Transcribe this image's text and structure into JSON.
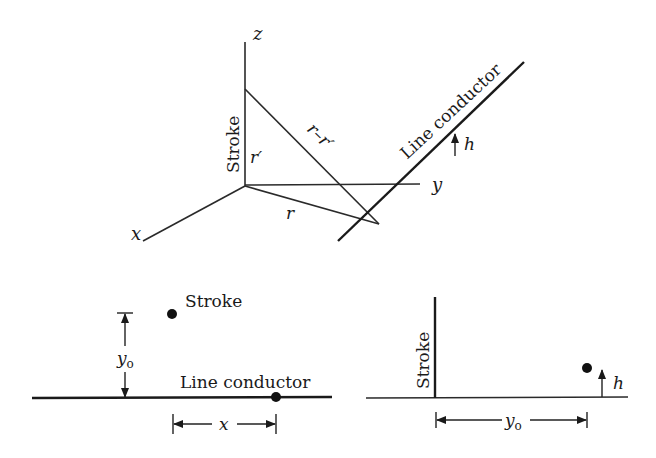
{
  "figure": {
    "top_panel": {
      "axes": {
        "x_label": "x",
        "y_label": "y",
        "z_label": "z"
      },
      "stroke_label": "Stroke",
      "r_label": "r",
      "r_prime_label": "r′",
      "r_minus_r_prime_label": "r–r′",
      "conductor_label": "Line conductor",
      "height_label": "h"
    },
    "bottom_left_panel": {
      "stroke_label": "Stroke",
      "conductor_label": "Line conductor",
      "y0_label_main": "y",
      "y0_label_sub": "o",
      "x_label": "x"
    },
    "bottom_right_panel": {
      "stroke_label": "Stroke",
      "height_label": "h",
      "y0_label_main": "y",
      "y0_label_sub": "o"
    }
  }
}
